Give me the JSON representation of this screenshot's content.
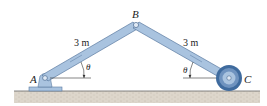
{
  "figure": {
    "points": {
      "A": "A",
      "B": "B",
      "C": "C"
    },
    "members": [
      {
        "name": "AB",
        "length_label": "3 m"
      },
      {
        "name": "BC",
        "length_label": "3 m"
      }
    ],
    "angles": {
      "at_A": "θ",
      "at_C": "θ"
    },
    "colors": {
      "member_fill": "#a9c3df",
      "member_stroke": "#5a7aa0",
      "wheel_outer": "#3f6b9e",
      "wheel_inner": "#a9c3df",
      "ground": "#d8d2c8",
      "ground_line": "#555555"
    }
  }
}
